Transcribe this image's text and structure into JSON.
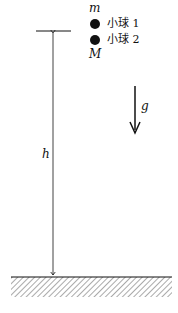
{
  "diagram": {
    "top_mass_label": "m",
    "bottom_mass_label": "M",
    "legend": [
      {
        "label": "小球 1"
      },
      {
        "label": "小球 2"
      }
    ],
    "height_label": "h",
    "gravity_label": "g",
    "colors": {
      "ink": "#111111",
      "hatch": "#555555"
    }
  }
}
